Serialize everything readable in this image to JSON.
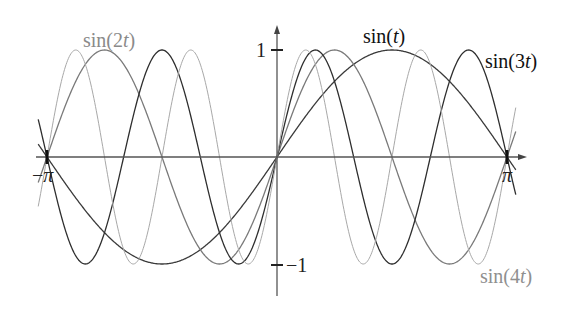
{
  "chart_data": {
    "type": "line",
    "title": "",
    "xlabel": "",
    "ylabel": "",
    "xlim": [
      -3.14159,
      3.14159
    ],
    "ylim": [
      -1,
      1
    ],
    "grid": false,
    "x_ticks": [
      {
        "value": -3.14159,
        "label": "−π"
      },
      {
        "value": 3.14159,
        "label": "π"
      }
    ],
    "y_ticks": [
      {
        "value": 1,
        "label": "1"
      },
      {
        "value": -1,
        "label": "−1"
      }
    ],
    "series": [
      {
        "name": "sin(t)",
        "frequency": 1,
        "color": "#3a3a3a",
        "label_color": "#111111"
      },
      {
        "name": "sin(2t)",
        "frequency": 2,
        "color": "#7a7a7a",
        "label_color": "#8a8a8a"
      },
      {
        "name": "sin(3t)",
        "frequency": 3,
        "color": "#2e2e2e",
        "label_color": "#111111"
      },
      {
        "name": "sin(4t)",
        "frequency": 4,
        "color": "#a8a8a8",
        "label_color": "#8f8f8f"
      }
    ],
    "annotations": [
      "sin(t)",
      "sin(2t)",
      "sin(3t)",
      "sin(4t)"
    ]
  },
  "labels": {
    "sin1": {
      "pre": "sin(",
      "var": "t",
      "post": ")"
    },
    "sin2": {
      "pre": "sin(2",
      "var": "t",
      "post": ")"
    },
    "sin3": {
      "pre": "sin(3",
      "var": "t",
      "post": ")"
    },
    "sin4": {
      "pre": "sin(4",
      "var": "t",
      "post": ")"
    }
  },
  "ticks": {
    "y_pos": "1",
    "y_neg": "−1",
    "x_neg_sign": "−",
    "x_neg_sym": "π",
    "x_pos_sym": "π"
  }
}
